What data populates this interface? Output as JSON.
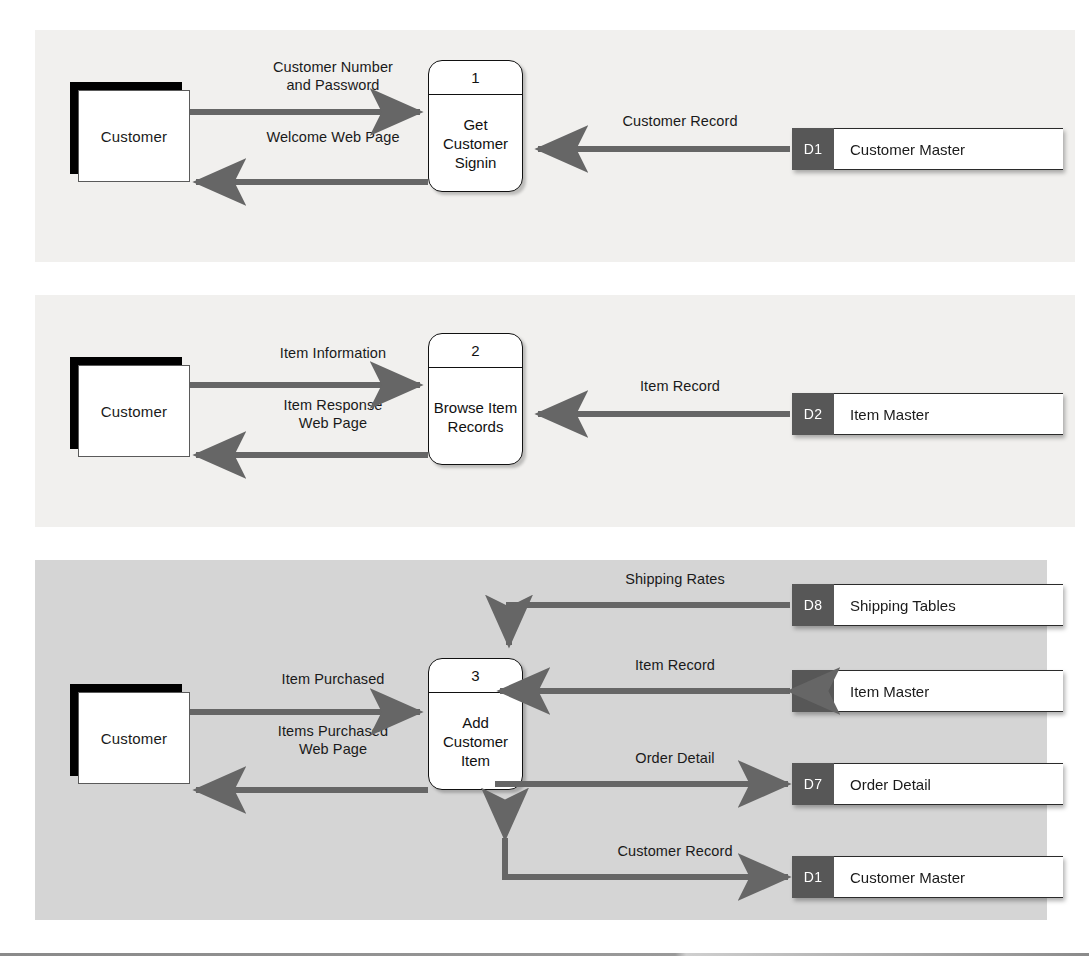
{
  "figure": {
    "panel_count": 3,
    "colors": {
      "panel_light_bg": "#f1f0ee",
      "panel_dark_bg": "#d5d5d5",
      "arrow_gray": "#666666",
      "store_id_gray": "#575757",
      "entity_shadow": "#000000",
      "page_bg": "#ffffff"
    }
  },
  "panels": [
    {
      "id": "panel-1",
      "entity": {
        "label": "Customer"
      },
      "process": {
        "number": "1",
        "name": "Get\nCustomer\nSignin"
      },
      "stores": [
        {
          "id": "D1",
          "name": "Customer Master"
        }
      ],
      "flows": [
        {
          "label": "Customer Number\nand Password",
          "direction": "entity-to-process"
        },
        {
          "label": "Welcome Web Page",
          "direction": "process-to-entity"
        },
        {
          "label": "Customer Record",
          "direction": "store-to-process"
        }
      ]
    },
    {
      "id": "panel-2",
      "entity": {
        "label": "Customer"
      },
      "process": {
        "number": "2",
        "name": "Browse\nItem\nRecords"
      },
      "stores": [
        {
          "id": "D2",
          "name": "Item Master"
        }
      ],
      "flows": [
        {
          "label": "Item Information",
          "direction": "entity-to-process"
        },
        {
          "label": "Item Response\nWeb Page",
          "direction": "process-to-entity"
        },
        {
          "label": "Item Record",
          "direction": "store-to-process"
        }
      ]
    },
    {
      "id": "panel-3",
      "entity": {
        "label": "Customer"
      },
      "process": {
        "number": "3",
        "name": "Add\nCustomer\nItem"
      },
      "stores": [
        {
          "id": "D8",
          "name": "Shipping Tables"
        },
        {
          "id": "D2",
          "name": "Item Master"
        },
        {
          "id": "D7",
          "name": "Order Detail"
        },
        {
          "id": "D1",
          "name": "Customer Master"
        }
      ],
      "flows": [
        {
          "label": "Item Purchased",
          "direction": "entity-to-process"
        },
        {
          "label": "Items Purchased\nWeb Page",
          "direction": "process-to-entity"
        },
        {
          "label": "Shipping Rates",
          "direction": "store-to-process-elbow"
        },
        {
          "label": "Item Record",
          "direction": "bidirectional"
        },
        {
          "label": "Order Detail",
          "direction": "process-to-store"
        },
        {
          "label": "Customer Record",
          "direction": "process-store-elbow-bidirectional"
        }
      ]
    }
  ]
}
